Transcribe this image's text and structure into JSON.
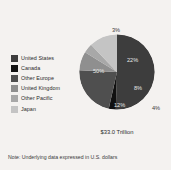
{
  "figure": {
    "background_color": "#f4f2f0",
    "note": "Note: Underlying data expressed in U.S. dollars",
    "total_label": "$33.0 Trillion"
  },
  "legend": {
    "items": [
      {
        "label": "United States",
        "color": "#3d3d3d"
      },
      {
        "label": "Canada",
        "color": "#111111"
      },
      {
        "label": "Other Europe",
        "color": "#4f4f4f"
      },
      {
        "label": "United Kingdom",
        "color": "#8f8f8f"
      },
      {
        "label": "Other Pacific",
        "color": "#a8a8a8"
      },
      {
        "label": "Japan",
        "color": "#c4c4c4"
      }
    ]
  },
  "chart_data": {
    "type": "pie",
    "title": "",
    "total": "$33.0 Trillion",
    "categories": [
      "United States",
      "Canada",
      "Other Europe",
      "United Kingdom",
      "Other Pacific",
      "Japan"
    ],
    "values": [
      50,
      3,
      22,
      8,
      4,
      12
    ],
    "value_labels": [
      "50%",
      "3%",
      "22%",
      "8%",
      "4%",
      "12%"
    ],
    "colors": [
      "#3d3d3d",
      "#111111",
      "#4f4f4f",
      "#8f8f8f",
      "#a8a8a8",
      "#c4c4c4"
    ],
    "label_positions": [
      "inside",
      "outside-top",
      "inside",
      "inside",
      "outside-right",
      "inside"
    ],
    "start_angle_deg": 0,
    "direction": "clockwise",
    "legend_position": "left",
    "grid": false,
    "note": "Note: Underlying data expressed in U.S. dollars"
  }
}
